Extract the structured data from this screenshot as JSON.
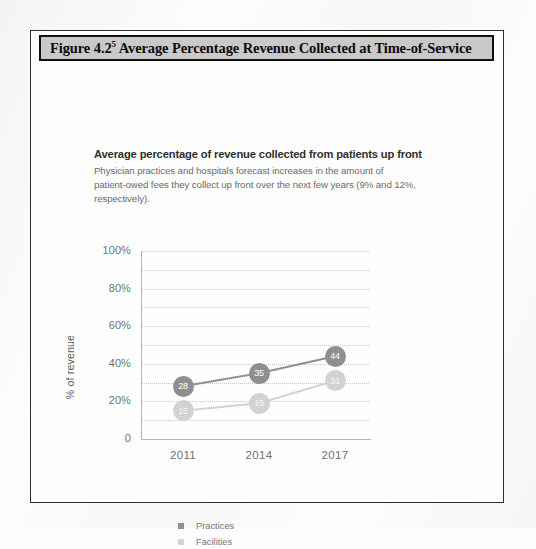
{
  "figure": {
    "number": "Figure 4.2",
    "superscript": "5",
    "title": "Average Percentage Revenue Collected at Time-of-Service"
  },
  "chart_heading": "Average percentage of revenue collected from patients up front",
  "chart_subtitle": "Physician practices and hospitals forecast increases in the amount of patient-owed fees they collect up front over the next few years (9% and 12%, respectively).",
  "colors": {
    "practices": "#8f8f8f",
    "facilities": "#d2d2d2",
    "title_bar_bg": "#c9c9c9",
    "frame_border": "#2e2e2e",
    "gridline": "#c6c6c6"
  },
  "chart_data": {
    "type": "line",
    "title": "Average percentage of revenue collected from patients up front",
    "xlabel": "",
    "ylabel": "% of revenue",
    "categories": [
      "2011",
      "2014",
      "2017"
    ],
    "ylim": [
      0,
      100
    ],
    "yticks": [
      "0",
      "20%",
      "40%",
      "60%",
      "80%",
      "100%"
    ],
    "ytick_values": [
      0,
      20,
      40,
      60,
      80,
      100
    ],
    "grid": "horizontal-dotted-every-10",
    "legend_position": "bottom-left",
    "series": [
      {
        "name": "Practices",
        "values": [
          28,
          35,
          44
        ],
        "labels": [
          "28",
          "35",
          "44"
        ],
        "color": "#8f8f8f"
      },
      {
        "name": "Facilities",
        "values": [
          15,
          19,
          31
        ],
        "labels": [
          "15",
          "19",
          "31"
        ],
        "color": "#d2d2d2"
      }
    ]
  }
}
